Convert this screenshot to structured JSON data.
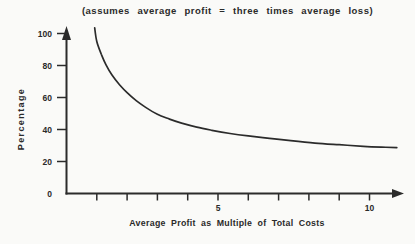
{
  "chart_data": {
    "type": "line",
    "title": "(assumes average profit = three times average loss)",
    "xlabel": "Average Profit as Multiple of Total Costs",
    "ylabel": "Percentage",
    "xlim": [
      0,
      11.2
    ],
    "ylim": [
      0,
      105
    ],
    "grid": false,
    "legend": null,
    "x_ticks": [
      {
        "value": 1,
        "label": ""
      },
      {
        "value": 2,
        "label": ""
      },
      {
        "value": 3,
        "label": ""
      },
      {
        "value": 4,
        "label": ""
      },
      {
        "value": 5,
        "label": "5"
      },
      {
        "value": 6,
        "label": ""
      },
      {
        "value": 7,
        "label": ""
      },
      {
        "value": 8,
        "label": ""
      },
      {
        "value": 9,
        "label": ""
      },
      {
        "value": 10,
        "label": "10"
      }
    ],
    "y_ticks": [
      {
        "value": 0,
        "label": "0",
        "tick": false
      },
      {
        "value": 20,
        "label": "20",
        "tick": true
      },
      {
        "value": 40,
        "label": "40",
        "tick": true
      },
      {
        "value": 60,
        "label": "60",
        "tick": true
      },
      {
        "value": 80,
        "label": "80",
        "tick": true
      },
      {
        "value": 100,
        "label": "100",
        "tick": true
      }
    ],
    "series": [
      {
        "name": "required-success-percentage",
        "points": [
          [
            0.93,
            103.5
          ],
          [
            1.0,
            95
          ],
          [
            1.15,
            87
          ],
          [
            1.3,
            80.5
          ],
          [
            1.5,
            74
          ],
          [
            1.75,
            68
          ],
          [
            2.0,
            63
          ],
          [
            2.3,
            58
          ],
          [
            2.6,
            54
          ],
          [
            3.0,
            49.5
          ],
          [
            3.4,
            46.5
          ],
          [
            3.8,
            44
          ],
          [
            4.3,
            41.5
          ],
          [
            4.8,
            39.5
          ],
          [
            5.4,
            37.5
          ],
          [
            6.0,
            36
          ],
          [
            6.7,
            34.5
          ],
          [
            7.4,
            33
          ],
          [
            8.2,
            31.5
          ],
          [
            9.0,
            30.5
          ],
          [
            9.8,
            29.5
          ],
          [
            10.4,
            29
          ],
          [
            10.9,
            28.7
          ]
        ]
      }
    ],
    "colors": {
      "line": "#2b2b2b",
      "axis": "#2b2b2b",
      "text": "#2a2a2a",
      "background": "#fafaf8"
    }
  }
}
